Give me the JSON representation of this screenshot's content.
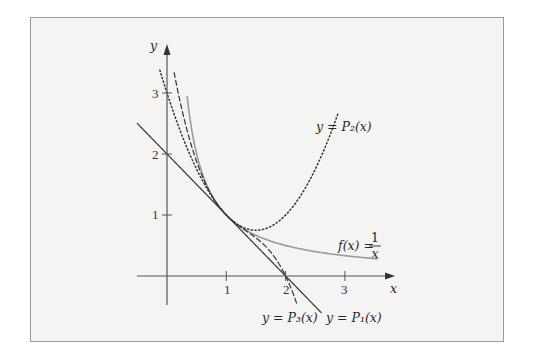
{
  "chart_data": {
    "type": "line",
    "title": "",
    "xlabel": "x",
    "ylabel": "y",
    "xlim": [
      -0.5,
      3.85
    ],
    "ylim": [
      -0.5,
      3.7
    ],
    "grid": false,
    "x_ticks": [
      1,
      2,
      3
    ],
    "y_ticks": [
      1,
      2,
      3
    ],
    "x_tick_labels": [
      "1",
      "2",
      "3"
    ],
    "y_tick_labels": [
      "1",
      "2",
      "3"
    ],
    "series": [
      {
        "name": "f(x) = 1/x",
        "label_lhs": "f(x) =",
        "label_num": "1",
        "label_den": "x",
        "formula": "1/x",
        "style": "solid-gray",
        "domain": [
          0.34,
          3.55
        ],
        "color": "#9b9b9b"
      },
      {
        "name": "y = P1(x)",
        "label": "y = P₁(x)",
        "formula": "1 - (x-1)",
        "style": "solid",
        "domain": [
          -0.5,
          2.6
        ],
        "color": "#333333"
      },
      {
        "name": "y = P2(x)",
        "label": "y = P₂(x)",
        "formula": "1 - (x-1) + (x-1)^2",
        "style": "dotted",
        "domain": [
          -0.12,
          2.88
        ],
        "color": "#333333"
      },
      {
        "name": "y = P3(x)",
        "label": "y = P₃(x)",
        "formula": "1 - (x-1) + (x-1)^2 - (x-1)^3",
        "style": "dashed",
        "domain": [
          0.12,
          2.2
        ],
        "color": "#333333"
      }
    ]
  }
}
